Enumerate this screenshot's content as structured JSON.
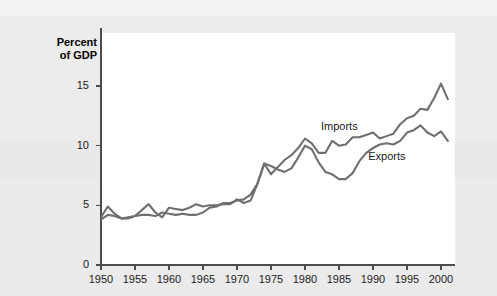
{
  "figure": {
    "axis_title_line1": "Percent",
    "axis_title_line2": "of GDP",
    "imports_label": "Imports",
    "exports_label": "Exports",
    "background_color": "#eaeaea",
    "plot_background_color": "#ffffff",
    "line_color": "#6f6f6f",
    "axis_color": "#4d4d4d",
    "text_color": "#1a1a1a"
  },
  "chart_data": {
    "type": "line",
    "title": "",
    "subtitle": "",
    "xlabel": "",
    "ylabel": "Percent of GDP",
    "xlim": [
      1949,
      2002
    ],
    "ylim": [
      0,
      17.5
    ],
    "grid": false,
    "legend": "inline-annotations",
    "y_ticks": [
      0,
      5,
      10,
      15
    ],
    "y_tick_labels": [
      "0",
      "5",
      "10",
      "15"
    ],
    "x_ticks": [
      1950,
      1955,
      1960,
      1965,
      1970,
      1975,
      1980,
      1985,
      1990,
      1995,
      2000
    ],
    "x_tick_labels": [
      "1950",
      "1955",
      "1960",
      "1965",
      "1970",
      "1975",
      "1980",
      "1985",
      "1990",
      "1995",
      "2000"
    ],
    "x": [
      1950,
      1951,
      1952,
      1953,
      1954,
      1955,
      1956,
      1957,
      1958,
      1959,
      1960,
      1961,
      1962,
      1963,
      1964,
      1965,
      1966,
      1967,
      1968,
      1969,
      1970,
      1971,
      1972,
      1973,
      1974,
      1975,
      1976,
      1977,
      1978,
      1979,
      1980,
      1981,
      1982,
      1983,
      1984,
      1985,
      1986,
      1987,
      1988,
      1989,
      1990,
      1991,
      1992,
      1993,
      1994,
      1995,
      1996,
      1997,
      1998,
      1999,
      2000,
      2001
    ],
    "series": [
      {
        "name": "Exports",
        "values": [
          4.0,
          4.9,
          4.3,
          3.9,
          4.0,
          4.1,
          4.6,
          5.1,
          4.4,
          4.0,
          4.8,
          4.7,
          4.6,
          4.8,
          5.1,
          4.9,
          5.0,
          5.0,
          5.1,
          5.1,
          5.5,
          5.2,
          5.4,
          6.8,
          8.5,
          8.3,
          8.0,
          7.8,
          8.1,
          9.0,
          10.0,
          9.7,
          8.6,
          7.8,
          7.6,
          7.2,
          7.2,
          7.7,
          8.7,
          9.4,
          9.8,
          10.1,
          10.2,
          10.1,
          10.4,
          11.1,
          11.3,
          11.7,
          11.1,
          10.8,
          11.2,
          10.4
        ]
      },
      {
        "name": "Imports",
        "values": [
          3.8,
          4.2,
          4.1,
          3.9,
          3.9,
          4.1,
          4.2,
          4.2,
          4.1,
          4.4,
          4.3,
          4.2,
          4.3,
          4.2,
          4.2,
          4.4,
          4.8,
          4.9,
          5.2,
          5.2,
          5.4,
          5.5,
          5.9,
          6.8,
          8.5,
          7.6,
          8.2,
          8.8,
          9.2,
          9.8,
          10.6,
          10.2,
          9.4,
          9.4,
          10.4,
          10.0,
          10.1,
          10.7,
          10.7,
          10.9,
          11.1,
          10.6,
          10.8,
          11.0,
          11.8,
          12.3,
          12.5,
          13.1,
          13.0,
          14.0,
          15.2,
          13.9
        ]
      }
    ],
    "annotations": [
      {
        "text": "Imports",
        "x": 1985,
        "y": 11.6,
        "series": "Imports"
      },
      {
        "text": "Exports",
        "x": 1989,
        "y": 9.05,
        "series": "Exports"
      }
    ]
  }
}
